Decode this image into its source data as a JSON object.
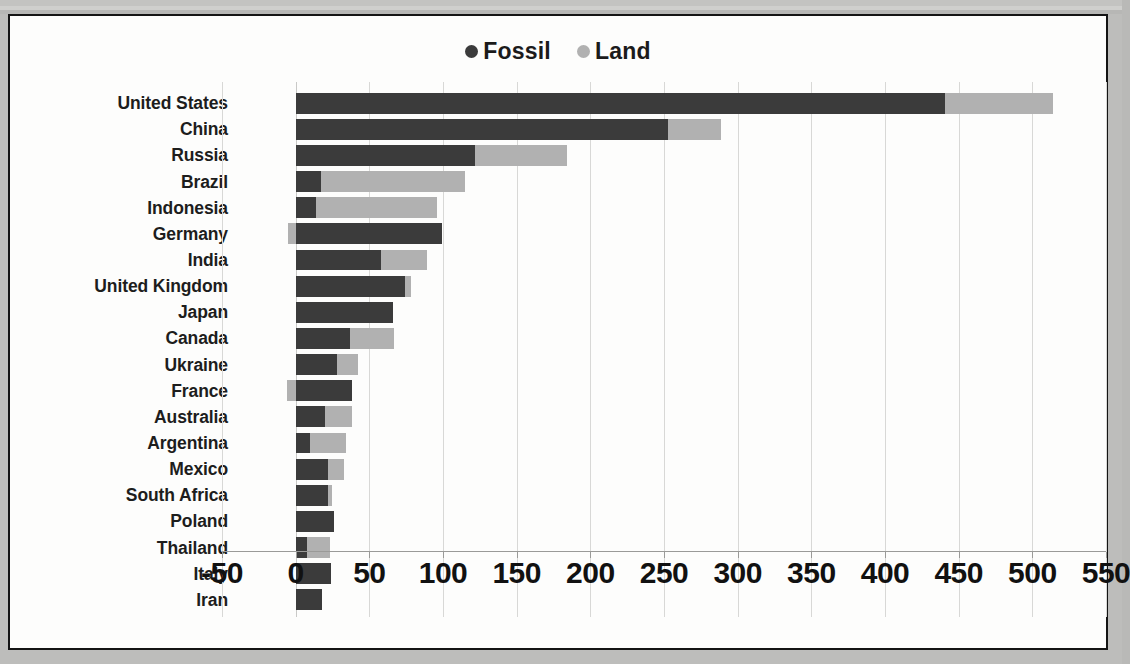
{
  "chart_data": {
    "type": "bar",
    "orientation": "horizontal",
    "stacked": true,
    "title": "",
    "xlabel": "",
    "ylabel": "",
    "xlim": [
      -50,
      550
    ],
    "xticks": [
      -50,
      0,
      50,
      100,
      150,
      200,
      250,
      300,
      350,
      400,
      450,
      500,
      550
    ],
    "grid": true,
    "legend_position": "top-center",
    "legend": [
      {
        "label": "Fossil",
        "color": "#3b3b3b",
        "marker": "circle"
      },
      {
        "label": "Land",
        "color": "#b1b1b1",
        "marker": "circle"
      }
    ],
    "categories": [
      "United States",
      "China",
      "Russia",
      "Brazil",
      "Indonesia",
      "Germany",
      "India",
      "United Kingdom",
      "Japan",
      "Canada",
      "Ukraine",
      "France",
      "Australia",
      "Argentina",
      "Mexico",
      "South Africa",
      "Poland",
      "Thailand",
      "Italy",
      "Iran"
    ],
    "series": [
      {
        "name": "Fossil",
        "color": "#3b3b3b",
        "values": [
          441,
          253,
          122,
          17,
          14,
          99,
          58,
          74,
          66,
          37,
          28,
          38,
          20,
          10,
          22,
          22,
          26,
          8,
          24,
          18
        ]
      },
      {
        "name": "Land",
        "color": "#b1b1b1",
        "values": [
          73,
          36,
          62,
          98,
          82,
          -5,
          31,
          4,
          0,
          30,
          14,
          -6,
          18,
          24,
          11,
          3,
          0,
          15,
          0,
          0
        ]
      }
    ],
    "totals": [
      514,
      289,
      184,
      115,
      96,
      99,
      89,
      78,
      66,
      67,
      42,
      38,
      38,
      34,
      33,
      25,
      26,
      23,
      24,
      18
    ]
  }
}
